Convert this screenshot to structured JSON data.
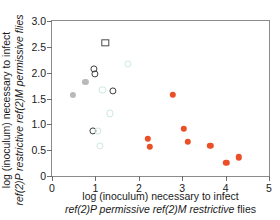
{
  "chart_data": {
    "type": "scatter",
    "title": "",
    "xlabel": "log (inoculum) necessary to infect ref(2)P permissive ref(2)M restrictive flies",
    "ylabel": "log (inoculum) necessary to infect ref(2)P restrictive ref(2)M permissive flies",
    "xlim": [
      0,
      5
    ],
    "ylim": [
      0,
      3.0
    ],
    "xticks": [
      "0",
      "1",
      "2",
      "3",
      "4",
      "5"
    ],
    "yticks": [
      "0",
      "0.5",
      "1.0",
      "1.5",
      "2.0",
      "2.5",
      "3.0"
    ],
    "grid": false,
    "legend": "none",
    "colors": {
      "filled": "#ea4f28",
      "open": "#3d3d3d",
      "square": "#4a4a4a",
      "grey": "#b9b9b9",
      "faint": "#cfe7e4",
      "axis": "#8c8c8c"
    },
    "series": [
      {
        "name": "restrictive-strains",
        "marker": "filled-circle",
        "color": "#ea4f28",
        "points": [
          {
            "x": 2.21,
            "y": 0.72
          },
          {
            "x": 2.26,
            "y": 0.56
          },
          {
            "x": 2.78,
            "y": 1.57
          },
          {
            "x": 3.03,
            "y": 0.91
          },
          {
            "x": 3.13,
            "y": 0.66
          },
          {
            "x": 3.65,
            "y": 0.58
          },
          {
            "x": 4.02,
            "y": 0.25
          },
          {
            "x": 4.31,
            "y": 0.36
          }
        ]
      },
      {
        "name": "permissive-strains",
        "marker": "open-circle",
        "color": "#3d3d3d",
        "points": [
          {
            "x": 0.96,
            "y": 2.07
          },
          {
            "x": 0.99,
            "y": 1.98
          },
          {
            "x": 1.4,
            "y": 1.65
          },
          {
            "x": 0.95,
            "y": 0.88
          }
        ]
      },
      {
        "name": "outlier-strain",
        "marker": "open-square",
        "color": "#4a4a4a",
        "points": [
          {
            "x": 1.23,
            "y": 2.58
          }
        ]
      },
      {
        "name": "grey-strains",
        "marker": "grey-circle",
        "color": "#b9b9b9",
        "points": [
          {
            "x": 0.48,
            "y": 1.57
          },
          {
            "x": 0.77,
            "y": 1.82
          }
        ]
      },
      {
        "name": "faint-strains",
        "marker": "faint-open-circle",
        "color": "#cfe7e4",
        "points": [
          {
            "x": 1.74,
            "y": 2.17
          },
          {
            "x": 1.16,
            "y": 1.66
          },
          {
            "x": 1.33,
            "y": 1.21
          },
          {
            "x": 1.1,
            "y": 0.58
          },
          {
            "x": 1.06,
            "y": 0.88
          }
        ]
      }
    ]
  },
  "axes": {
    "x_title_line1": "log (inoculum) necessary to infect",
    "x_title_line2_italic": "ref(2)P permissive ref(2)M restrictive",
    "x_title_line2_tail": " flies",
    "y_title_line1": "log (inoculum) necessary to infect",
    "y_title_line2_italic": "ref(2)P restrictive ref(2)M permissive flies"
  }
}
